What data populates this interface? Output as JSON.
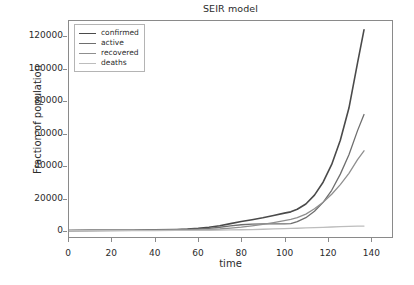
{
  "chart_data": {
    "type": "line",
    "title": "SEIR model",
    "xlabel": "time",
    "ylabel": "Fraction of population",
    "xlim": [
      0,
      150
    ],
    "ylim": [
      -4000,
      130000
    ],
    "xticks": [
      0,
      20,
      40,
      60,
      80,
      100,
      120,
      140
    ],
    "xtick_labels": [
      "0",
      "20",
      "40",
      "60",
      "80",
      "100",
      "120",
      "140"
    ],
    "yticks": [
      0,
      20000,
      40000,
      60000,
      80000,
      100000,
      120000
    ],
    "ytick_labels": [
      "0",
      "20000",
      "40000",
      "60000",
      "80000",
      "100000",
      "120000"
    ],
    "grid": false,
    "legend_position": "upper left",
    "series": [
      {
        "name": "confirmed",
        "color": "#4a4a4a",
        "linewidth": 1.6,
        "x": [
          0,
          10,
          20,
          30,
          40,
          50,
          55,
          60,
          65,
          70,
          75,
          80,
          85,
          90,
          95,
          100,
          103,
          106,
          110,
          114,
          118,
          122,
          126,
          130,
          134,
          137
        ],
        "y": [
          60,
          90,
          140,
          230,
          400,
          700,
          950,
          1350,
          2000,
          3000,
          4300,
          5600,
          6700,
          7900,
          9300,
          10800,
          11600,
          13200,
          16500,
          22000,
          30000,
          41000,
          56000,
          76000,
          104000,
          124500
        ]
      },
      {
        "name": "active",
        "color": "#6e6e6e",
        "linewidth": 1.3,
        "x": [
          0,
          10,
          20,
          30,
          40,
          50,
          55,
          60,
          65,
          70,
          75,
          80,
          85,
          90,
          95,
          100,
          103,
          106,
          110,
          114,
          118,
          122,
          126,
          130,
          134,
          137
        ],
        "y": [
          40,
          60,
          100,
          165,
          290,
          500,
          680,
          960,
          1400,
          2050,
          2850,
          3600,
          4000,
          4100,
          4150,
          4200,
          4300,
          5500,
          8000,
          12000,
          17500,
          25000,
          35000,
          47000,
          62000,
          72000
        ]
      },
      {
        "name": "recovered",
        "color": "#8f8f8f",
        "linewidth": 1.3,
        "x": [
          0,
          10,
          20,
          30,
          40,
          50,
          55,
          60,
          65,
          70,
          75,
          80,
          85,
          90,
          95,
          100,
          103,
          106,
          110,
          114,
          118,
          122,
          126,
          130,
          134,
          137
        ],
        "y": [
          15,
          25,
          40,
          65,
          110,
          200,
          280,
          400,
          620,
          960,
          1500,
          2100,
          2900,
          3800,
          4900,
          6100,
          6900,
          8000,
          10200,
          13500,
          17500,
          22500,
          28500,
          35500,
          44000,
          49500
        ]
      },
      {
        "name": "deaths",
        "color": "#bdbdbd",
        "linewidth": 1.3,
        "x": [
          0,
          10,
          20,
          30,
          40,
          50,
          55,
          60,
          65,
          70,
          75,
          80,
          85,
          90,
          95,
          100,
          103,
          106,
          110,
          114,
          118,
          122,
          126,
          130,
          134,
          137
        ],
        "y": [
          5,
          8,
          12,
          20,
          35,
          60,
          85,
          120,
          180,
          270,
          380,
          500,
          640,
          800,
          980,
          1180,
          1300,
          1420,
          1600,
          1800,
          2000,
          2200,
          2380,
          2550,
          2700,
          2800
        ]
      }
    ]
  },
  "legend": {
    "items": [
      {
        "label": "confirmed"
      },
      {
        "label": "active"
      },
      {
        "label": "recovered"
      },
      {
        "label": "deaths"
      }
    ]
  }
}
